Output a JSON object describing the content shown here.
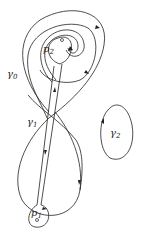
{
  "diagram": {
    "labels": {
      "p2": {
        "base": "p",
        "sub": "2"
      },
      "p1": {
        "base": "p",
        "sub": "1"
      },
      "gamma0": {
        "base": "γ",
        "sub": "0"
      },
      "gamma1": {
        "base": "γ",
        "sub": "1"
      },
      "gamma2": {
        "base": "γ",
        "sub": "2"
      }
    },
    "points": [
      "p1",
      "p2"
    ],
    "curves": [
      "gamma0",
      "gamma1",
      "gamma2"
    ],
    "colors": {
      "stroke": "#222222",
      "background": "#ffffff"
    }
  }
}
